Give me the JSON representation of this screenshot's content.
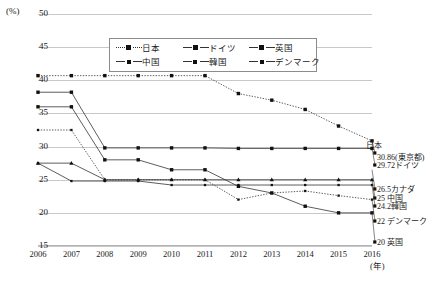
{
  "chart_data": {
    "type": "line",
    "title": "",
    "xlabel": "(年)",
    "ylabel": "(%)",
    "ylim": [
      15,
      50
    ],
    "yticks": [
      15,
      20,
      25,
      30,
      35,
      40,
      45,
      50
    ],
    "grid": true,
    "legend_position": "top-center",
    "categories": [
      2006,
      2007,
      2008,
      2009,
      2010,
      2011,
      2012,
      2013,
      2014,
      2015,
      2016
    ],
    "series": [
      {
        "name": "日本",
        "style": "dotted",
        "marker": "square-large",
        "values": [
          40.7,
          40.7,
          40.7,
          40.7,
          40.7,
          40.7,
          38.0,
          37.0,
          35.6,
          33.1,
          30.86
        ]
      },
      {
        "name": "ドイツ",
        "style": "solid",
        "marker": "square-large",
        "values": [
          38.2,
          38.2,
          29.8,
          29.8,
          29.8,
          29.8,
          29.72,
          29.72,
          29.72,
          29.72,
          29.72
        ]
      },
      {
        "name": "英国",
        "style": "solid",
        "marker": "square-large",
        "values": [
          36.0,
          36.0,
          28.0,
          28.0,
          26.5,
          26.5,
          24.0,
          23.0,
          21.0,
          20.0,
          20.0
        ]
      },
      {
        "name": "中国",
        "style": "solid",
        "marker": "triangle",
        "values": [
          27.5,
          27.5,
          25.0,
          25.0,
          25.0,
          25.0,
          25.0,
          25.0,
          25.0,
          25.0,
          25.0
        ]
      },
      {
        "name": "韓国",
        "style": "solid",
        "marker": "square-small",
        "values": [
          27.5,
          24.8,
          24.8,
          24.8,
          24.2,
          24.2,
          24.2,
          24.2,
          24.2,
          24.2,
          24.2
        ]
      },
      {
        "name": "デンマーク",
        "style": "dotted",
        "marker": "square-small",
        "values": [
          32.5,
          32.5,
          25.0,
          25.0,
          25.0,
          25.0,
          22.0,
          23.0,
          23.3,
          22.6,
          22.0
        ]
      }
    ],
    "end_labels": [
      {
        "text": "日本",
        "value": null
      },
      {
        "text": "30.86(東京都)",
        "value": 30.86
      },
      {
        "text": "29.72ドイツ",
        "value": 29.72
      },
      {
        "text": "26.5カナダ",
        "value": 26.5
      },
      {
        "text": "25  中国",
        "value": 25
      },
      {
        "text": "24.2韓国",
        "value": 24.2
      },
      {
        "text": "22 デンマーク",
        "value": 22
      },
      {
        "text": "20  英国",
        "value": 20
      }
    ]
  },
  "axes": {
    "y_unit": "(%)",
    "x_unit": "(年)",
    "yticks": [
      "50",
      "45",
      "40",
      "35",
      "30",
      "25",
      "20",
      "15"
    ],
    "xticks": [
      "2006",
      "2007",
      "2008",
      "2009",
      "2010",
      "2011",
      "2012",
      "2013",
      "2014",
      "2015",
      "2016"
    ]
  },
  "legend": {
    "items": [
      {
        "label": "日本",
        "marker": "square-large",
        "style": "dotted"
      },
      {
        "label": "ドイツ",
        "marker": "square-large",
        "style": "solid"
      },
      {
        "label": "英国",
        "marker": "square-large",
        "style": "solid"
      },
      {
        "label": "中国",
        "marker": "triangle",
        "style": "solid"
      },
      {
        "label": "韓国",
        "marker": "square-small",
        "style": "solid"
      },
      {
        "label": "デンマーク",
        "marker": "square-small",
        "style": "solid"
      }
    ]
  },
  "annotations": {
    "a_japan": "日本",
    "a_tokyo": "30.86(東京都)",
    "a_germany": "29.72ドイツ",
    "a_canada": "26.5カナダ",
    "a_china": "25  中国",
    "a_korea": "24.2韓国",
    "a_denmark": "22 デンマーク",
    "a_uk": "20  英国"
  },
  "colors": {
    "line": "#333333",
    "grid": "#c8c8c8",
    "text": "#1a1a1a",
    "background": "#ffffff"
  }
}
